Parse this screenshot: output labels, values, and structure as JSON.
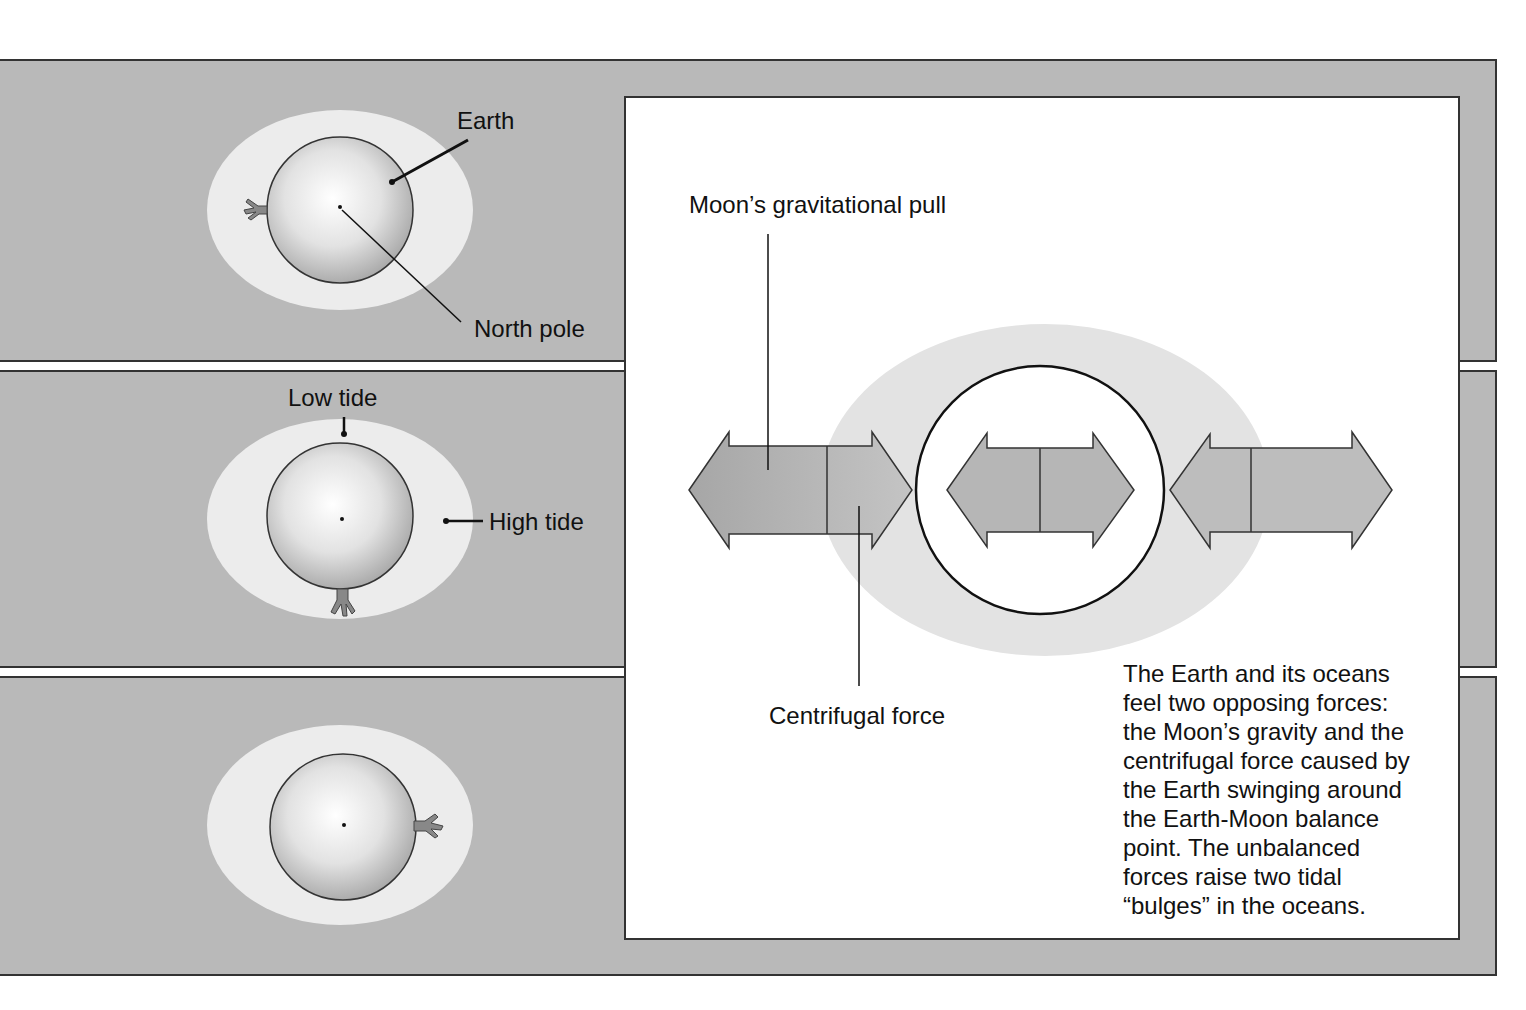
{
  "left_panels": [
    {
      "id": "panel-1",
      "labels": {
        "earth": "Earth",
        "north_pole": "North pole"
      }
    },
    {
      "id": "panel-2",
      "labels": {
        "low_tide": "Low tide",
        "high_tide": "High tide"
      }
    },
    {
      "id": "panel-3",
      "labels": {}
    }
  ],
  "main_panel": {
    "labels": {
      "moon_pull": "Moon’s gravitational pull",
      "centrifugal": "Centrifugal force"
    },
    "description_lines": [
      "The Earth and its oceans",
      "feel two opposing forces:",
      "the Moon’s gravity and the",
      "centrifugal force caused by",
      "the Earth swinging around",
      "the Earth-Moon balance",
      "point. The unbalanced",
      "forces raise two tidal",
      "“bulges” in the oceans."
    ]
  },
  "colors": {
    "band": "#b9b9b9",
    "ocean": "#ececec",
    "arrow": "#a9a9a9",
    "outline": "#333333"
  }
}
